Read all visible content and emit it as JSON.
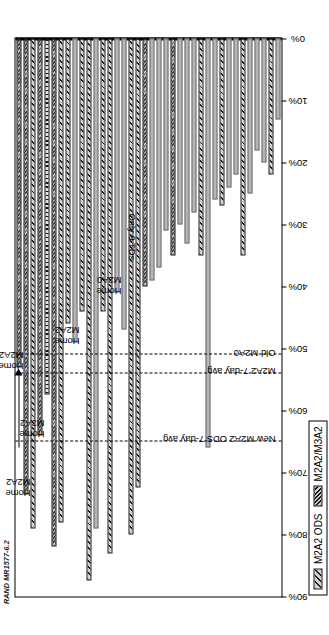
{
  "source_id": "RAND MR1577-6.2",
  "caption": "Each column respresents an infantry battalion or cavalry squadron during FY99, FY00, and FY01 NTC rotations.",
  "legend": {
    "items": [
      {
        "label": "M2A2 ODS",
        "pattern": "diagonal-hatch",
        "color": "#d2d2d2"
      },
      {
        "label": "M2A2/M3A2",
        "pattern": "cross-hatch",
        "color": "#cfcfcf"
      }
    ]
  },
  "axis": {
    "ticks": [
      "90%",
      "80%",
      "70%",
      "60%",
      "50%",
      "40%",
      "30%",
      "20%",
      "10%",
      "0%"
    ],
    "min": 0,
    "max": 90
  },
  "reference_lines": [
    {
      "label": "New M2A2 ODS 7-day avg",
      "value": 65
    },
    {
      "label": "M2A2 7-day avg",
      "value": 54
    },
    {
      "label": "Old M2A0",
      "value": 51
    }
  ],
  "annotations": [
    {
      "text": "Home\nM2A2",
      "for_bar": 0
    },
    {
      "text": "Home\nM2A2",
      "for_bar": 1
    },
    {
      "text": "Home\nM3A2",
      "for_bar": 3
    },
    {
      "text": "Home\nM2A2",
      "for_bar": 8
    },
    {
      "text": "Home\nM2A0",
      "for_bar": 14
    },
    {
      "text": "Only 9 TDs",
      "for_bar": 15
    }
  ],
  "chart_data": {
    "type": "bar",
    "title": "",
    "xlabel": "",
    "ylabel": "",
    "ylim": [
      0,
      90
    ],
    "grid": false,
    "legend_position": "bottom-left",
    "orientation": "vertical-rotated",
    "note": "Values are percentages; bars are drawn from the 0% baseline.",
    "categories": [
      "c1",
      "c2",
      "c3",
      "c4",
      "c5",
      "c6",
      "c7",
      "c8",
      "c9",
      "c10",
      "c11",
      "c12",
      "c13",
      "c14",
      "c15",
      "c16",
      "c17",
      "c18",
      "c19",
      "c20",
      "c21",
      "c22",
      "c23",
      "c24",
      "c25",
      "c26",
      "c27",
      "c28",
      "c29",
      "c30",
      "c31",
      "c32",
      "c33",
      "c34",
      "c35",
      "c36",
      "c37",
      "c38"
    ],
    "series": [
      {
        "name": "percent",
        "values": [
          53.0,
          73.5,
          79.0,
          64.0,
          57.5,
          82.0,
          78.0,
          46.0,
          49.0,
          44.0,
          87.5,
          79.0,
          44.0,
          83.0,
          41.0,
          47.0,
          80.0,
          72.5,
          40.0,
          39.0,
          37.0,
          31.0,
          35.0,
          30.0,
          33.0,
          28.0,
          35.0,
          66.0,
          26.0,
          27.0,
          24.0,
          22.0,
          35.0,
          25.0,
          18.0,
          20.0,
          22.0,
          13.0
        ],
        "patterns": [
          "cross-hatch",
          "cross-hatch",
          "diagonal-hatch",
          "cross-hatch",
          "vertical-hatch",
          "cross-hatch",
          "diagonal-hatch",
          "diagonal-hatch",
          "solid",
          "diagonal-hatch",
          "diagonal-hatch",
          "solid",
          "diagonal-hatch",
          "diagonal-hatch",
          "solid",
          "solid",
          "diagonal-hatch",
          "diagonal-hatch",
          "cross-hatch",
          "solid",
          "solid",
          "solid",
          "cross-hatch",
          "solid",
          "solid",
          "solid",
          "diagonal-hatch",
          "solid",
          "solid",
          "diagonal-hatch",
          "solid",
          "solid",
          "diagonal-hatch",
          "solid",
          "solid",
          "solid",
          "diagonal-hatch",
          "solid"
        ]
      }
    ]
  }
}
